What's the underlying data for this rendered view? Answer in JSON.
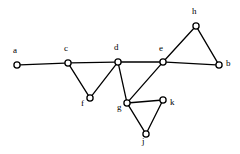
{
  "figure": {
    "kind": "undirected-graph-drawing",
    "background_color": "#ffffff",
    "stroke_color": "#000000",
    "vertex_fill_color": "#ffffff",
    "width": 240,
    "height": 154
  },
  "graph": {
    "vertex_count": 10,
    "edge_count": 13,
    "vertices": [
      {
        "id": "a",
        "label": "a",
        "x": 17,
        "y": 65,
        "label_x": 13,
        "label_y": 46
      },
      {
        "id": "c",
        "label": "c",
        "x": 68,
        "y": 63,
        "label_x": 64,
        "label_y": 44
      },
      {
        "id": "d",
        "label": "d",
        "x": 118,
        "y": 62,
        "label_x": 114,
        "label_y": 43
      },
      {
        "id": "e",
        "label": "e",
        "x": 163,
        "y": 62,
        "label_x": 159,
        "label_y": 44
      },
      {
        "id": "b",
        "label": "b",
        "x": 219,
        "y": 65,
        "label_x": 226,
        "label_y": 59
      },
      {
        "id": "f",
        "label": "f",
        "x": 90,
        "y": 98,
        "label_x": 81,
        "label_y": 99
      },
      {
        "id": "g",
        "label": "g",
        "x": 127,
        "y": 103,
        "label_x": 117,
        "label_y": 103
      },
      {
        "id": "h",
        "label": "h",
        "x": 196,
        "y": 26,
        "label_x": 192,
        "label_y": 7
      },
      {
        "id": "k",
        "label": "k",
        "x": 163,
        "y": 100,
        "label_x": 170,
        "label_y": 98
      },
      {
        "id": "j",
        "label": "j",
        "x": 146,
        "y": 134,
        "label_x": 142,
        "label_y": 137
      }
    ],
    "edges": [
      {
        "from": "a",
        "to": "c"
      },
      {
        "from": "c",
        "to": "d"
      },
      {
        "from": "d",
        "to": "e"
      },
      {
        "from": "e",
        "to": "b"
      },
      {
        "from": "c",
        "to": "f"
      },
      {
        "from": "f",
        "to": "d"
      },
      {
        "from": "d",
        "to": "g"
      },
      {
        "from": "g",
        "to": "e"
      },
      {
        "from": "e",
        "to": "h"
      },
      {
        "from": "h",
        "to": "b"
      },
      {
        "from": "g",
        "to": "k"
      },
      {
        "from": "k",
        "to": "j"
      },
      {
        "from": "j",
        "to": "g"
      }
    ]
  }
}
